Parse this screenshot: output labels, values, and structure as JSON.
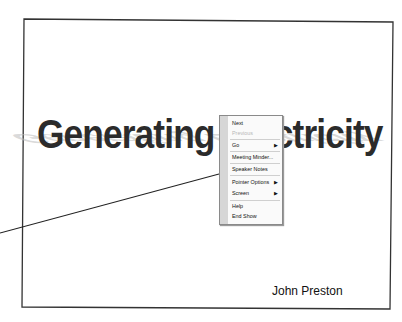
{
  "slide": {
    "title": "Generating Electricity",
    "author": "John Preston",
    "frame_color": "#333333",
    "title_color": "#2b2b2b"
  },
  "context_menu": {
    "items": [
      {
        "label": "Next",
        "enabled": true,
        "submenu": false
      },
      {
        "label": "Previous",
        "enabled": false,
        "submenu": false
      },
      {
        "label": "Go",
        "enabled": true,
        "submenu": true
      },
      {
        "label": "Meeting Minder...",
        "enabled": true,
        "submenu": false
      },
      {
        "label": "Speaker Notes",
        "enabled": true,
        "submenu": false
      },
      {
        "label": "Pointer Options",
        "enabled": true,
        "submenu": true
      },
      {
        "label": "Screen",
        "enabled": true,
        "submenu": true
      },
      {
        "label": "Help",
        "enabled": true,
        "submenu": false
      },
      {
        "label": "End Show",
        "enabled": true,
        "submenu": false
      }
    ],
    "submenu_arrow_icon": "▶"
  }
}
